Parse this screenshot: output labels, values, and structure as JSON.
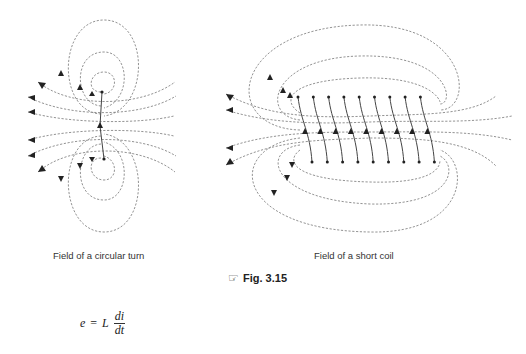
{
  "figure": {
    "label": "Fig. 3.15",
    "icon": "pointing-hand-icon",
    "icon_glyph": "☞",
    "panels": [
      {
        "caption": "Field of a circular turn"
      },
      {
        "caption": "Field of a short coil",
        "turns": 9
      }
    ]
  },
  "equation": {
    "lhs": "e",
    "equals": "=",
    "coefficient": "L",
    "numerator": "di",
    "denominator": "dt"
  }
}
